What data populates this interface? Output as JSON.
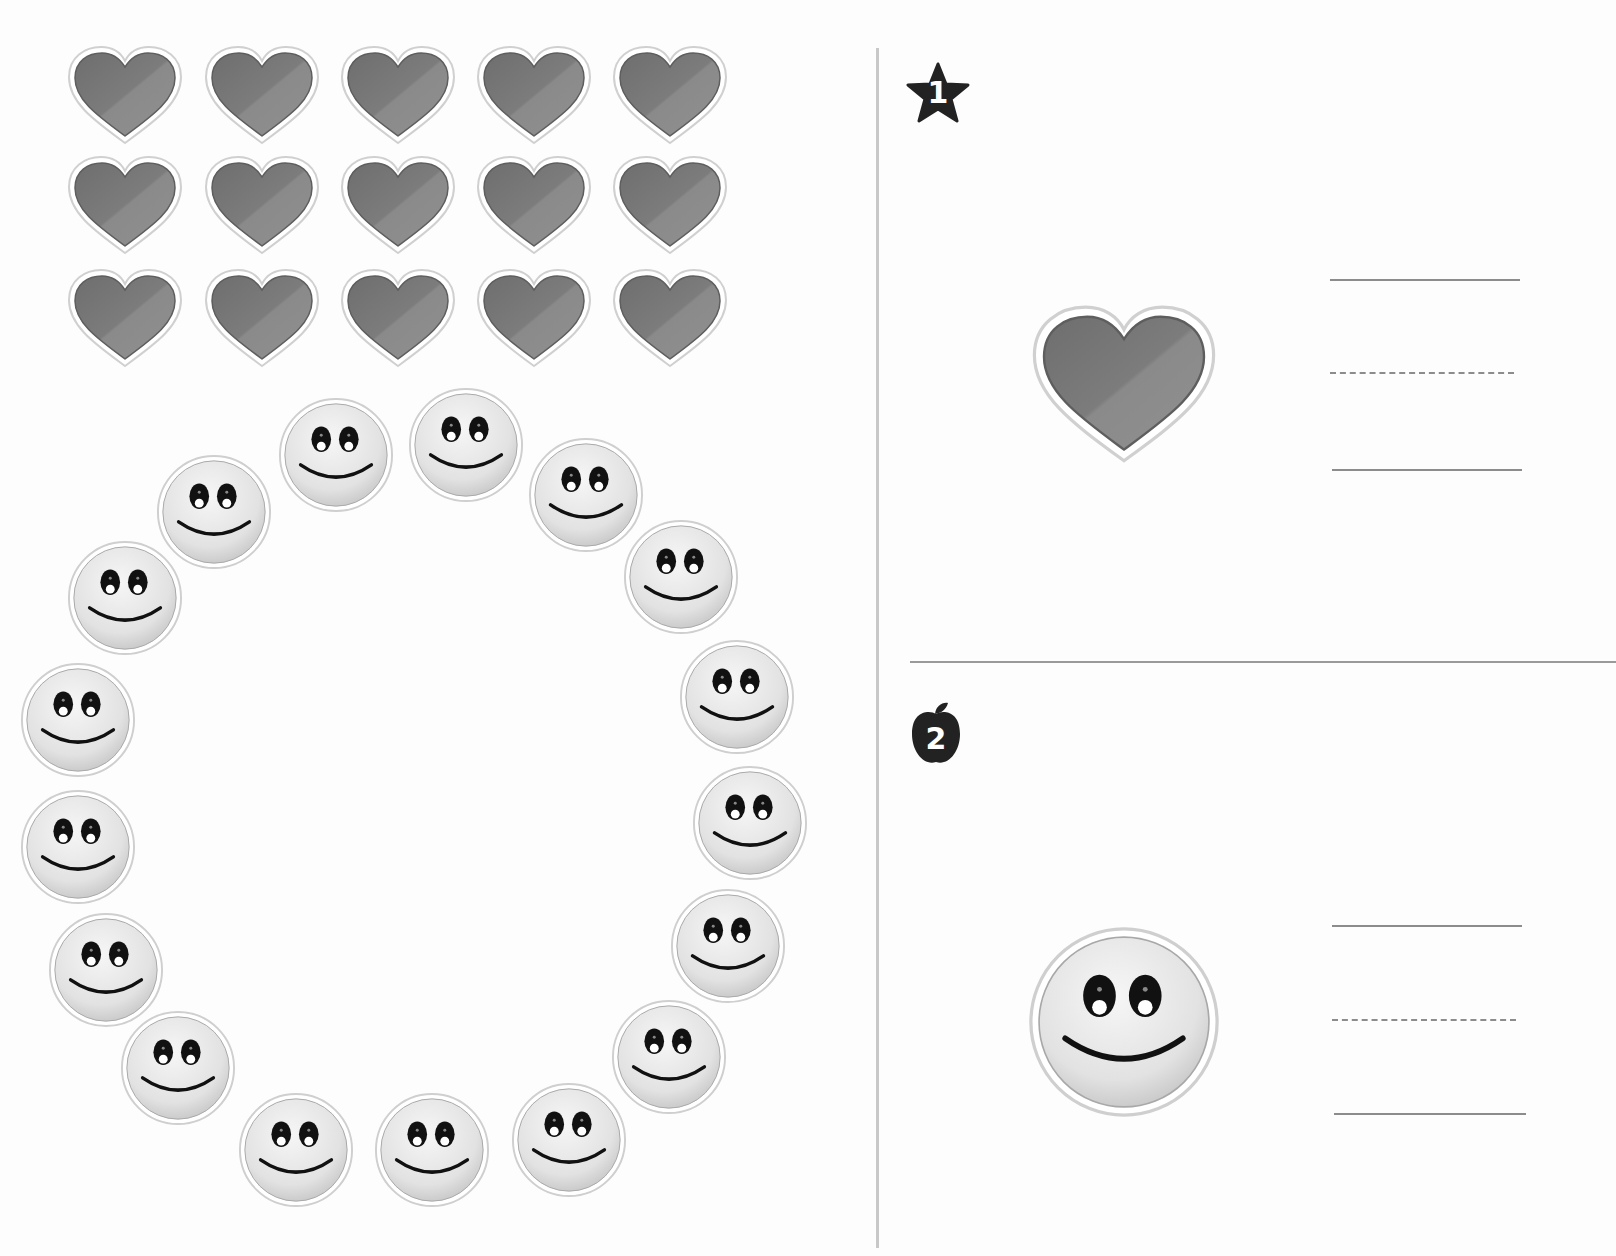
{
  "worksheet": {
    "type": "counting-worksheet",
    "left_panel": {
      "hearts": {
        "rows": 3,
        "cols": 5,
        "count": 15,
        "color": "#7a7a7a",
        "positions": [
          [
            125,
            95
          ],
          [
            262,
            95
          ],
          [
            398,
            95
          ],
          [
            534,
            95
          ],
          [
            670,
            95
          ],
          [
            125,
            205
          ],
          [
            262,
            205
          ],
          [
            398,
            205
          ],
          [
            534,
            205
          ],
          [
            670,
            205
          ],
          [
            125,
            318
          ],
          [
            262,
            318
          ],
          [
            398,
            318
          ],
          [
            534,
            318
          ],
          [
            670,
            318
          ]
        ]
      },
      "smileys": {
        "count": 17,
        "arrangement": "ring",
        "face_color": "#e6e6e6",
        "positions": [
          [
            336,
            455
          ],
          [
            466,
            445
          ],
          [
            586,
            495
          ],
          [
            681,
            577
          ],
          [
            737,
            697
          ],
          [
            750,
            823
          ],
          [
            728,
            946
          ],
          [
            669,
            1057
          ],
          [
            569,
            1140
          ],
          [
            432,
            1150
          ],
          [
            296,
            1150
          ],
          [
            178,
            1068
          ],
          [
            106,
            970
          ],
          [
            78,
            847
          ],
          [
            78,
            720
          ],
          [
            125,
            598
          ],
          [
            214,
            512
          ]
        ]
      }
    },
    "right_panel": {
      "exercises": [
        {
          "number": "1",
          "badge_shape": "star",
          "badge_color": "#222222",
          "item": "heart",
          "answer_lines": [
            "solid",
            "dashed",
            "solid"
          ]
        },
        {
          "number": "2",
          "badge_shape": "apple",
          "badge_color": "#222222",
          "item": "smiley",
          "answer_lines": [
            "solid",
            "dashed",
            "solid"
          ]
        }
      ]
    }
  }
}
